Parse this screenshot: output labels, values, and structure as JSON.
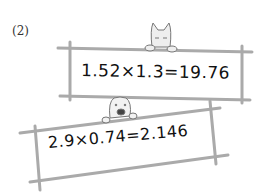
{
  "problem_label": "(2)",
  "boards": [
    {
      "equation": "1.52×1.3=19.76",
      "character": "cat-icon"
    },
    {
      "equation": "2.9×0.74=2.146",
      "character": "dog-icon"
    }
  ],
  "colors": {
    "frame": "#a9a9a9",
    "text": "#111111"
  }
}
